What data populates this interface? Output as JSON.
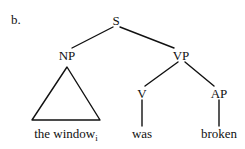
{
  "figure": {
    "item_label": "b.",
    "background_color": "#ffffff",
    "ink_color": "#111111",
    "caption_text": "the window"
  },
  "tree": {
    "nodes": [
      {
        "id": "S",
        "label": "S",
        "x": 116,
        "y": 20
      },
      {
        "id": "NP",
        "label": "NP",
        "x": 67,
        "y": 55
      },
      {
        "id": "VP",
        "label": "VP",
        "x": 181,
        "y": 55
      },
      {
        "id": "V",
        "label": "V",
        "x": 142,
        "y": 93
      },
      {
        "id": "AP",
        "label": "AP",
        "x": 219,
        "y": 93
      }
    ],
    "edges": [
      {
        "from": "S",
        "to": "NP",
        "x1": 113,
        "y1": 27,
        "x2": 72,
        "y2": 48
      },
      {
        "from": "S",
        "to": "VP",
        "x1": 120,
        "y1": 27,
        "x2": 174,
        "y2": 48
      },
      {
        "from": "VP",
        "to": "V",
        "x1": 178,
        "y1": 62,
        "x2": 145,
        "y2": 86
      },
      {
        "from": "VP",
        "to": "AP",
        "x1": 185,
        "y1": 62,
        "x2": 214,
        "y2": 86
      },
      {
        "from": "V",
        "to": "was",
        "x1": 142,
        "y1": 100,
        "x2": 142,
        "y2": 126
      },
      {
        "from": "AP",
        "to": "broken",
        "x1": 219,
        "y1": 100,
        "x2": 219,
        "y2": 126
      }
    ],
    "triangle": {
      "parent": "NP",
      "apex_x": 67,
      "apex_y": 67,
      "base_left_x": 32,
      "base_right_x": 100,
      "base_y": 120
    },
    "terminals": [
      {
        "id": "np-terminal",
        "text": "the window",
        "subscript": "i",
        "x": 66,
        "y": 127
      },
      {
        "id": "v-terminal",
        "text": "was",
        "subscript": "",
        "x": 142,
        "y": 127
      },
      {
        "id": "ap-terminal",
        "text": "broken",
        "subscript": "",
        "x": 219,
        "y": 127
      }
    ]
  }
}
